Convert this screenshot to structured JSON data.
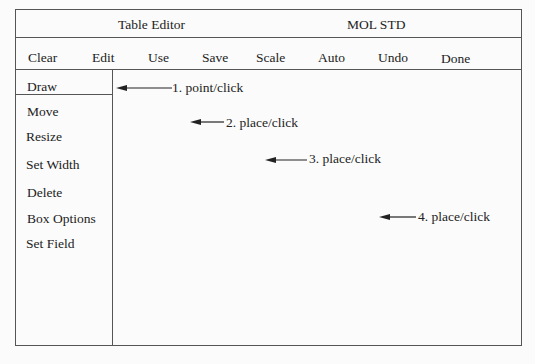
{
  "header": {
    "title": "Table Editor",
    "mode": "MOL STD"
  },
  "menubar": {
    "items": [
      {
        "label": "Clear"
      },
      {
        "label": "Edit"
      },
      {
        "label": "Use"
      },
      {
        "label": "Save"
      },
      {
        "label": "Scale"
      },
      {
        "label": "Auto"
      },
      {
        "label": "Undo"
      },
      {
        "label": "Done"
      }
    ]
  },
  "sidebar": {
    "items": [
      {
        "label": "Draw",
        "selected": true
      },
      {
        "label": "Move"
      },
      {
        "label": "Resize"
      },
      {
        "label": "Set Width"
      },
      {
        "label": "Delete"
      },
      {
        "label": "Box Options"
      },
      {
        "label": "Set Field"
      }
    ]
  },
  "annotations": [
    {
      "label": "1. point/click"
    },
    {
      "label": "2. place/click"
    },
    {
      "label": "3. place/click"
    },
    {
      "label": "4. place/click"
    }
  ],
  "colors": {
    "line": "#555555",
    "text": "#222222",
    "background": "#fbfbfb"
  }
}
